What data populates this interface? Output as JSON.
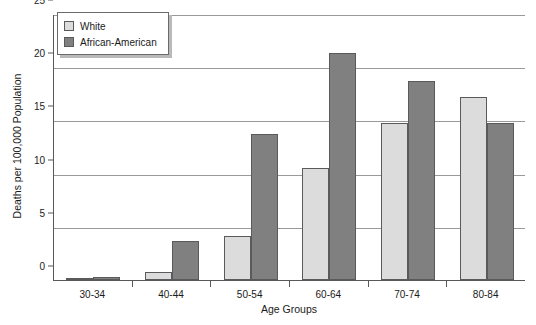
{
  "chart_data": {
    "type": "bar",
    "title": "",
    "xlabel": "Age Groups",
    "ylabel": "Deaths per 100,000 Population",
    "categories": [
      "30-34",
      "40-44",
      "50-54",
      "60-64",
      "70-74",
      "80-84"
    ],
    "series": [
      {
        "name": "White",
        "color": "#dcdcdc",
        "values": [
          0.1,
          0.8,
          4.1,
          10.5,
          14.8,
          17.2
        ]
      },
      {
        "name": "African-American",
        "color": "#808080",
        "values": [
          0.3,
          3.7,
          13.7,
          21.3,
          18.7,
          14.8
        ]
      }
    ],
    "ylim": [
      0,
      25
    ],
    "yticks": [
      0,
      5,
      10,
      15,
      20,
      25
    ],
    "ytick_labels": [
      "0",
      "5",
      "10",
      "15",
      "20",
      "25"
    ],
    "grid": true,
    "grid_axis": "y",
    "legend_position": "top-left"
  },
  "colors": {
    "axis": "#59595b",
    "grid": "#9a9a9c",
    "bar_border": "#5a5a5c",
    "text": "#1a1a1a",
    "background": "#ffffff"
  }
}
